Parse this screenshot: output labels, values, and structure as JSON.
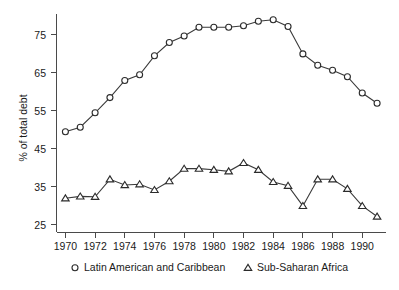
{
  "chart_data": {
    "type": "line",
    "title": "",
    "xlabel": "",
    "ylabel": "% of total debt",
    "xlim": [
      1969.4,
      1991.6
    ],
    "ylim": [
      23.0,
      80.5
    ],
    "yticks": [
      25,
      35,
      45,
      55,
      65,
      75
    ],
    "xticks": [
      1970,
      1972,
      1974,
      1976,
      1978,
      1980,
      1982,
      1984,
      1986,
      1988,
      1990
    ],
    "grid": false,
    "legend_position": "below-axes",
    "x": [
      1970,
      1971,
      1972,
      1973,
      1974,
      1975,
      1976,
      1977,
      1978,
      1979,
      1980,
      1981,
      1982,
      1983,
      1984,
      1985,
      1986,
      1987,
      1988,
      1989,
      1990,
      1991
    ],
    "series": [
      {
        "name": "Latin American and Caribbean",
        "marker": "circle",
        "values": [
          49.5,
          50.7,
          54.5,
          58.5,
          63.0,
          64.5,
          69.5,
          73.0,
          74.7,
          77.0,
          77.0,
          77.0,
          77.4,
          78.6,
          79.0,
          77.2,
          70.0,
          67.0,
          65.7,
          64.0,
          59.7,
          57.0
        ]
      },
      {
        "name": "Sub-Saharan Africa",
        "marker": "triangle",
        "values": [
          32.0,
          32.5,
          32.4,
          37.0,
          35.5,
          35.7,
          34.2,
          36.5,
          39.8,
          39.8,
          39.5,
          39.1,
          41.3,
          39.5,
          36.3,
          35.3,
          30.0,
          37.0,
          37.0,
          34.5,
          30.0,
          27.2
        ]
      }
    ]
  },
  "axis": {
    "ylabel": "% of total debt",
    "ytick_labels": [
      "75",
      "65",
      "55",
      "45",
      "35",
      "25"
    ],
    "xtick_labels": [
      "1970",
      "1972",
      "1974",
      "1976",
      "1978",
      "1980",
      "1982",
      "1984",
      "1986",
      "1988",
      "1990"
    ]
  },
  "legend": {
    "entries": [
      {
        "marker_glyph": "circle",
        "label": "Latin American and Caribbean"
      },
      {
        "marker_glyph": "triangle",
        "label": "Sub-Saharan Africa"
      }
    ]
  },
  "colors": {
    "axis": "#4a4a4a",
    "line": "#3a3a3a",
    "marker_fill": "#ffffff",
    "marker_stroke": "#2b2b2b",
    "text": "#1a1a1a",
    "background": "#ffffff"
  }
}
